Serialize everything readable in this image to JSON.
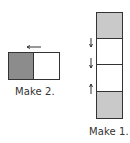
{
  "diagram": {
    "left_figure": {
      "label": "Make 2.",
      "cells": [
        {
          "fill": "#8c8c8c",
          "shaded": true
        },
        {
          "fill": "#ffffff",
          "shaded": false
        }
      ],
      "arrow": {
        "direction": "left"
      }
    },
    "right_figure": {
      "label": "Make 1.",
      "cells": [
        {
          "fill": "#c9c9c9",
          "shaded": true
        },
        {
          "fill": "#ffffff",
          "shaded": false
        },
        {
          "fill": "#ffffff",
          "shaded": false
        },
        {
          "fill": "#c9c9c9",
          "shaded": true
        }
      ],
      "arrows": [
        {
          "direction": "down"
        },
        {
          "direction": "down"
        },
        {
          "direction": "up"
        }
      ]
    },
    "colors": {
      "stroke": "#333333",
      "dark_shade": "#8c8c8c",
      "light_shade": "#c9c9c9"
    }
  }
}
